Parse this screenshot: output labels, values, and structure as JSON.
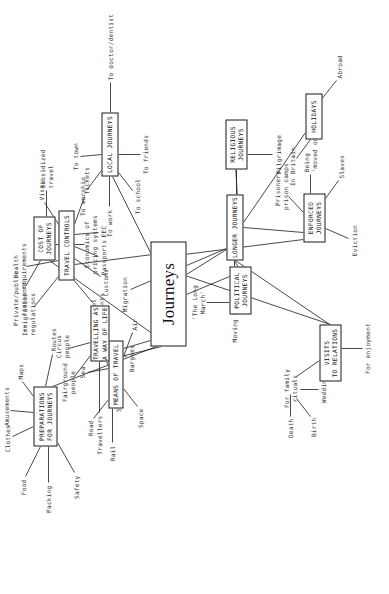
{
  "diagram": {
    "title": "Journeys",
    "type": "mind-map",
    "orientation": "rotated-90-ccw",
    "center": {
      "label": "Journeys"
    },
    "nodes": [
      {
        "id": "preparations",
        "label": "PREPARATIONS\nFOR JOURNEYS"
      },
      {
        "id": "means",
        "label": "MEANS OF TRAVEL"
      },
      {
        "id": "travel_controls",
        "label": "TRAVEL CONTROLS"
      },
      {
        "id": "way_of_life",
        "label": "TRAVELLING AS\nA WAY OF LIFE"
      },
      {
        "id": "cost",
        "label": "COST OF\nJOURNEYS"
      },
      {
        "id": "local",
        "label": "LOCAL JOURNEYS"
      },
      {
        "id": "political",
        "label": "POLITICAL\nJOURNEYS"
      },
      {
        "id": "visits",
        "label": "VISITS\nTO RELATIONS"
      },
      {
        "id": "longer",
        "label": "LONGER JOURNEYS"
      },
      {
        "id": "enforced",
        "label": "ENFORCED\nJOURNEYS"
      },
      {
        "id": "religious",
        "label": "RELIGIOUS\nJOURNEYS"
      },
      {
        "id": "holidays",
        "label": "HOLIDAYS"
      }
    ],
    "leaves": {
      "preparations": [
        "Food",
        "Packing",
        "Safety",
        "Clothes",
        "Amusements",
        "Maps",
        "Routes"
      ],
      "means": [
        "Rail",
        "Road",
        "Sea",
        "Air",
        "Space"
      ],
      "travel_controls": [
        "Immigration\nregulations",
        "Health\nrequirements",
        "Visas",
        "Tickets",
        "EEC",
        "Passports",
        "Customs",
        "Travel\ndocuments"
      ],
      "way_of_life": [
        "Travellers",
        "Fairground\npeople",
        "Circus\npeople",
        "Sailors",
        "Bargees"
      ],
      "cost": [
        "Private/public\ntransport",
        "Subsidized\ntravel",
        "Economics of\npricing systems"
      ],
      "local": [
        "To worship",
        "To town",
        "To work",
        "To doctor/dentist",
        "To school",
        "To friends"
      ],
      "political": [
        "'The Long\nMarch'"
      ],
      "visits": [
        "For family\nrituals",
        "Death",
        "Birth",
        "Wedding",
        "For enjoyment"
      ],
      "longer": [
        "Moving house",
        "Migration"
      ],
      "enforced": [
        "Prisoners,\nprison camps",
        "Being\n'moved on'",
        "Slaves",
        "Eviction"
      ],
      "religious": [
        "Exodus",
        "Pilgrimage"
      ],
      "holidays": [
        "In Britain",
        "Abroad"
      ]
    }
  },
  "placement": {
    "center": {
      "x": 248,
      "y": 150,
      "w": 105,
      "h": 36
    },
    "nodes": {
      "preparations": {
        "x": 148,
        "y": 33,
        "w": 60,
        "h": 24
      },
      "means": {
        "x": 186,
        "y": 108,
        "w": 68,
        "h": 15
      },
      "travel_controls": {
        "x": 314,
        "y": 58,
        "w": 70,
        "h": 16
      },
      "way_of_life": {
        "x": 233,
        "y": 90,
        "w": 56,
        "h": 19
      },
      "cost": {
        "x": 334,
        "y": 33,
        "w": 44,
        "h": 22
      },
      "local": {
        "x": 418,
        "y": 101,
        "w": 64,
        "h": 17
      },
      "political": {
        "x": 280,
        "y": 229,
        "w": 48,
        "h": 22
      },
      "visits": {
        "x": 213,
        "y": 319,
        "w": 57,
        "h": 22
      },
      "longer": {
        "x": 334,
        "y": 226,
        "w": 66,
        "h": 17
      },
      "enforced": {
        "x": 352,
        "y": 303,
        "w": 49,
        "h": 22
      },
      "religious": {
        "x": 425,
        "y": 225,
        "w": 50,
        "h": 22
      },
      "holidays": {
        "x": 455,
        "y": 305,
        "w": 46,
        "h": 17
      }
    }
  },
  "colors": {
    "background": "#ffffff",
    "stroke": "#1a1a1a",
    "leaf_text": "#3a3a3a",
    "node_text": "#111111"
  }
}
